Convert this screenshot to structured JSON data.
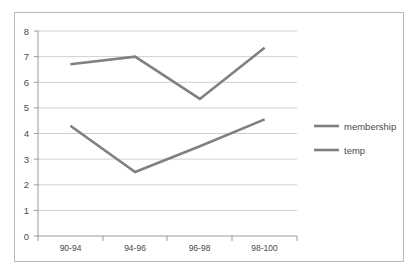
{
  "chart_data": {
    "type": "line",
    "title": "",
    "subtitle": "",
    "xlabel": "",
    "ylabel": "",
    "categories": [
      "90-94",
      "94-96",
      "96-98",
      "98-100"
    ],
    "series": [
      {
        "name": "membership",
        "values": [
          6.7,
          7.0,
          5.35,
          7.35
        ],
        "color": "#808080"
      },
      {
        "name": "temp",
        "values": [
          4.3,
          2.5,
          3.5,
          4.55
        ],
        "color": "#808080"
      }
    ],
    "ylim": [
      0,
      8
    ],
    "yticks": [
      0,
      1,
      2,
      3,
      4,
      5,
      6,
      7,
      8
    ],
    "ytick_labels": [
      "0",
      "1",
      "2",
      "3",
      "4",
      "5",
      "6",
      "7",
      "8"
    ],
    "grid": true,
    "grid_axis": "y",
    "legend_position": "right",
    "colors": {
      "grid": "#c4c4c4",
      "axis": "#9a9a9a",
      "text": "#4a4a4a",
      "border": "#b9b9b9",
      "background": "#ffffff",
      "series_membership": "#808080",
      "series_temp": "#808080"
    }
  },
  "legend": {
    "items": [
      {
        "label": "membership"
      },
      {
        "label": "temp"
      }
    ]
  },
  "axes": {
    "y_tick_labels": [
      "8",
      "7",
      "6",
      "5",
      "4",
      "3",
      "2",
      "1",
      "0"
    ],
    "x_tick_labels": [
      "90-94",
      "94-96",
      "96-98",
      "98-100"
    ]
  }
}
